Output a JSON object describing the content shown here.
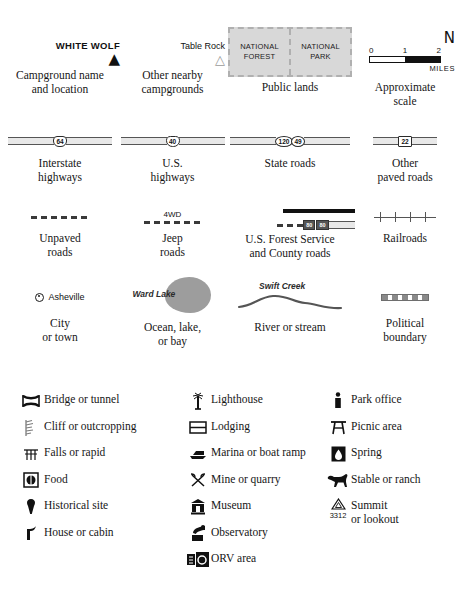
{
  "top_grid": {
    "campground_primary": {
      "name": "WHITE WOLF",
      "icon": "tent-icon",
      "caption": "Campground name\nand location"
    },
    "campground_other": {
      "name": "Table Rock",
      "icon": "tent-icon-grey",
      "caption": "Other nearby\ncampgrounds"
    },
    "public_lands": {
      "left_line1": "NATIONAL",
      "left_line2": "FOREST",
      "right_line1": "NATIONAL",
      "right_line2": "PARK",
      "caption": "Public lands",
      "fill_color": "#d8d8d8",
      "border_color": "#b0b0b0"
    },
    "scale": {
      "north_label": "N",
      "ticks": [
        "0",
        "1",
        "2"
      ],
      "units": "MILES",
      "caption": "Approximate\nscale"
    },
    "interstate": {
      "shield_number": "64",
      "caption": "Interstate\nhighways"
    },
    "us_highway": {
      "shield_number": "40",
      "caption": "U.S.\nhighways"
    },
    "state_roads": {
      "shield_number_1": "120",
      "shield_number_2": "49",
      "caption": "State roads"
    },
    "other_paved": {
      "shield_number": "22",
      "caption": "Other\npaved roads"
    },
    "unpaved": {
      "caption": "Unpaved\nroads"
    },
    "jeep": {
      "label": "4WD",
      "caption": "Jeep\nroads"
    },
    "forest_service": {
      "badge_1": "80",
      "badge_2": "80",
      "caption": "U.S. Forest Service\nand County roads"
    },
    "railroads": {
      "caption": "Railroads"
    },
    "city": {
      "name": "Asheville",
      "caption": "City\nor town"
    },
    "water_body": {
      "name": "Ward Lake",
      "caption": "Ocean, lake,\nor bay",
      "fill_color": "#9d9d9d"
    },
    "river": {
      "name": "Swift Creek",
      "caption": "River or stream"
    },
    "political_boundary": {
      "caption": "Political\nboundary"
    }
  },
  "symbol_columns": [
    {
      "items": [
        {
          "icon": "bridge-or-tunnel-icon",
          "label": "Bridge or tunnel"
        },
        {
          "icon": "cliff-or-outcropping-icon",
          "label": "Cliff or outcropping"
        },
        {
          "icon": "falls-or-rapid-icon",
          "label": "Falls or rapid"
        },
        {
          "icon": "food-icon",
          "label": "Food"
        },
        {
          "icon": "historical-site-icon",
          "label": "Historical site"
        },
        {
          "icon": "house-or-cabin-icon",
          "label": "House or cabin"
        }
      ]
    },
    {
      "items": [
        {
          "icon": "lighthouse-icon",
          "label": "Lighthouse"
        },
        {
          "icon": "lodging-icon",
          "label": "Lodging"
        },
        {
          "icon": "marina-or-boat-ramp-icon",
          "label": "Marina or boat ramp"
        },
        {
          "icon": "mine-or-quarry-icon",
          "label": "Mine or quarry"
        },
        {
          "icon": "museum-icon",
          "label": "Museum"
        },
        {
          "icon": "observatory-icon",
          "label": "Observatory"
        },
        {
          "icon": "orv-area-icon",
          "label": "ORV area"
        }
      ]
    },
    {
      "items": [
        {
          "icon": "park-office-icon",
          "label": "Park office"
        },
        {
          "icon": "picnic-area-icon",
          "label": "Picnic area"
        },
        {
          "icon": "spring-icon",
          "label": "Spring"
        },
        {
          "icon": "stable-or-ranch-icon",
          "label": "Stable or ranch"
        },
        {
          "icon": "summit-or-lookout-icon",
          "label": "Summit\nor lookout",
          "elevation": "3312"
        }
      ]
    }
  ]
}
